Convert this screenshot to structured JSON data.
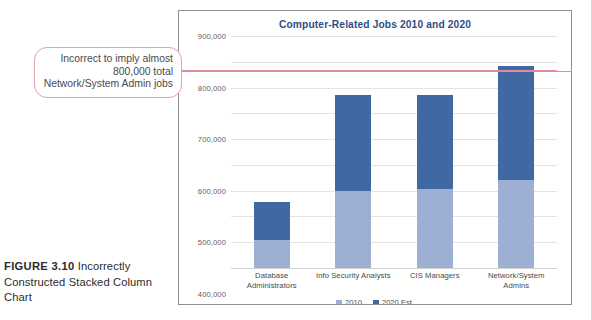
{
  "figure": {
    "label": "FIGURE 3.10",
    "caption": "Incorrectly Constructed Stacked Column Chart"
  },
  "callout": {
    "text": "Incorrect to imply almost 800,000 total Network/System Admin jobs",
    "border_color": "#e8a0a8",
    "leader_line_color": "#e08d98",
    "leader_value": 770000
  },
  "chart": {
    "title": "Computer-Related Jobs 2010 and 2020",
    "title_color": "#2f4d86",
    "border_color": "#8f8f8f"
  },
  "legend": {
    "items": [
      {
        "label": "2010",
        "color": "#9dafd3"
      },
      {
        "label": "2020 Est.",
        "color": "#4069a4"
      }
    ]
  },
  "axis": {
    "yticks": [
      "900,000",
      "800,000",
      "700,000",
      "600,000",
      "500,000",
      "400,000",
      "300,000",
      "200,000",
      "100,000",
      "-"
    ]
  },
  "chart_data": {
    "type": "bar",
    "stacked": true,
    "title": "Computer-Related Jobs 2010 and 2020",
    "xlabel": "",
    "ylabel": "",
    "ylim": [
      0,
      900000
    ],
    "ytick_step": 100000,
    "grid": true,
    "legend_position": "bottom",
    "categories": [
      "Database Administrators",
      "Info Security Analysts",
      "CIS Managers",
      "Network/System Admins"
    ],
    "series": [
      {
        "name": "2010",
        "color": "#9dafd3",
        "values": [
          110000,
          300000,
          305000,
          340000
        ]
      },
      {
        "name": "2020 Est.",
        "color": "#4069a4",
        "values": [
          145000,
          370000,
          365000,
          445000
        ]
      }
    ],
    "stacked_totals": [
      255000,
      670000,
      670000,
      785000
    ],
    "annotations": [
      {
        "type": "hline",
        "value": 770000,
        "color": "#e08d98",
        "text": "Incorrect to imply almost 800,000 total Network/System Admin jobs"
      }
    ]
  }
}
